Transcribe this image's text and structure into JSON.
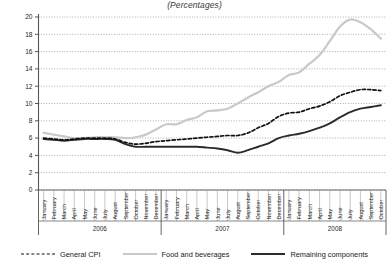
{
  "chart_data": {
    "type": "line",
    "title": "(Percentages)",
    "xlabel": "",
    "ylabel": "",
    "ylim": [
      0,
      20
    ],
    "yticks": [
      0,
      2,
      4,
      6,
      8,
      10,
      12,
      14,
      16,
      18,
      20
    ],
    "grid": true,
    "legend_position": "bottom",
    "years": [
      {
        "label": "2006",
        "months": [
          "January",
          "February",
          "March",
          "April",
          "May",
          "June",
          "July",
          "August",
          "September",
          "October",
          "November",
          "December"
        ]
      },
      {
        "label": "2007",
        "months": [
          "January",
          "February",
          "March",
          "April",
          "May",
          "June",
          "July",
          "August",
          "September",
          "October",
          "November",
          "December"
        ]
      },
      {
        "label": "2008",
        "months": [
          "January",
          "February",
          "March",
          "April",
          "May",
          "June",
          "July",
          "August",
          "September",
          "October"
        ]
      }
    ],
    "categories": [
      "January 2006",
      "February 2006",
      "March 2006",
      "April 2006",
      "May 2006",
      "June 2006",
      "July 2006",
      "August 2006",
      "September 2006",
      "October 2006",
      "November 2006",
      "December 2006",
      "January 2007",
      "February 2007",
      "March 2007",
      "April 2007",
      "May 2007",
      "June 2007",
      "July 2007",
      "August 2007",
      "September 2007",
      "October 2007",
      "November 2007",
      "December 2007",
      "January 2008",
      "February 2008",
      "March 2008",
      "April 2008",
      "May 2008",
      "June 2008",
      "July 2008",
      "August 2008",
      "September 2008",
      "October 2008"
    ],
    "series": [
      {
        "name": "General CPI",
        "color": "#111111",
        "style": "dashed",
        "values": [
          6.0,
          5.9,
          5.8,
          5.9,
          6.0,
          6.0,
          6.0,
          5.9,
          5.5,
          5.3,
          5.4,
          5.6,
          5.7,
          5.8,
          5.9,
          6.0,
          6.1,
          6.2,
          6.3,
          6.3,
          6.6,
          7.2,
          7.7,
          8.5,
          8.9,
          9.0,
          9.4,
          9.7,
          10.2,
          10.9,
          11.3,
          11.6,
          11.6,
          11.5
        ]
      },
      {
        "name": "Food and beverages",
        "color": "#c9c9c9",
        "style": "solid",
        "values": [
          6.6,
          6.4,
          6.2,
          6.0,
          6.0,
          6.1,
          6.1,
          6.1,
          6.0,
          6.1,
          6.4,
          7.0,
          7.6,
          7.6,
          8.1,
          8.4,
          9.1,
          9.2,
          9.4,
          10.0,
          10.7,
          11.3,
          12.0,
          12.5,
          13.3,
          13.6,
          14.6,
          15.6,
          17.2,
          18.9,
          19.7,
          19.4,
          18.6,
          17.5
        ]
      },
      {
        "name": "Remaining components",
        "color": "#2b2b2b",
        "style": "solid",
        "values": [
          5.9,
          5.8,
          5.7,
          5.8,
          5.9,
          5.9,
          5.9,
          5.8,
          5.3,
          5.0,
          5.0,
          5.0,
          5.0,
          5.0,
          5.0,
          5.0,
          4.9,
          4.8,
          4.6,
          4.3,
          4.6,
          5.0,
          5.4,
          6.0,
          6.3,
          6.5,
          6.8,
          7.2,
          7.7,
          8.4,
          9.0,
          9.4,
          9.6,
          9.8
        ]
      }
    ]
  },
  "legend": {
    "items": [
      {
        "label": "General CPI",
        "swatch": "dashed-line-icon"
      },
      {
        "label": "Food and beverages",
        "swatch": "light-line-icon"
      },
      {
        "label": "Remaining components",
        "swatch": "dark-line-icon"
      }
    ]
  }
}
